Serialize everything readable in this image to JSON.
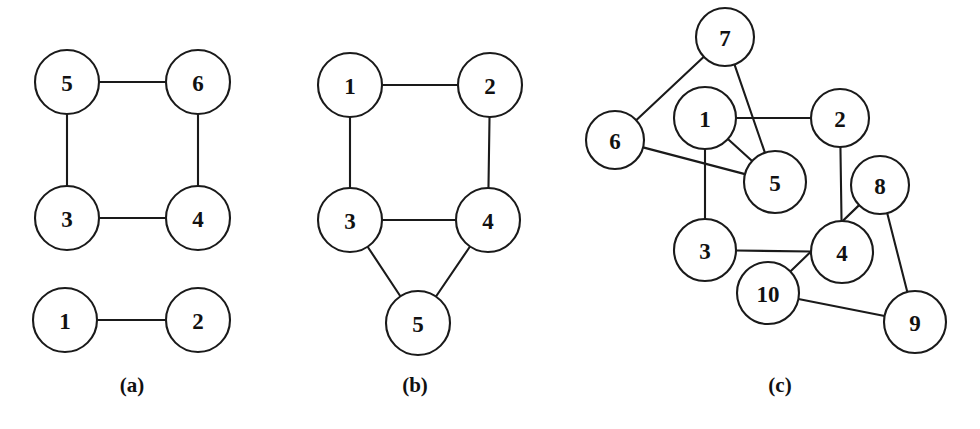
{
  "figure": {
    "background_color": "#ffffff",
    "stroke_color": "#1a1a1a",
    "node_fill_color": "#ffffff",
    "width": 980,
    "height": 429
  },
  "panels": [
    {
      "id": "panel-a",
      "caption": "(a)",
      "caption_x": 132,
      "caption_y": 385,
      "nodes": [
        {
          "label": "5",
          "x": 67,
          "y": 82,
          "r": 32
        },
        {
          "label": "6",
          "x": 198,
          "y": 82,
          "r": 32
        },
        {
          "label": "3",
          "x": 67,
          "y": 218,
          "r": 32
        },
        {
          "label": "4",
          "x": 198,
          "y": 218,
          "r": 32
        },
        {
          "label": "1",
          "x": 65,
          "y": 320,
          "r": 32
        },
        {
          "label": "2",
          "x": 198,
          "y": 320,
          "r": 32
        }
      ],
      "edges": [
        [
          "5",
          "6"
        ],
        [
          "5",
          "3"
        ],
        [
          "3",
          "4"
        ],
        [
          "6",
          "4"
        ],
        [
          "1",
          "2"
        ]
      ]
    },
    {
      "id": "panel-b",
      "caption": "(b)",
      "caption_x": 415,
      "caption_y": 385,
      "nodes": [
        {
          "label": "1",
          "x": 350,
          "y": 85,
          "r": 32
        },
        {
          "label": "2",
          "x": 490,
          "y": 85,
          "r": 32
        },
        {
          "label": "3",
          "x": 350,
          "y": 220,
          "r": 32
        },
        {
          "label": "4",
          "x": 488,
          "y": 220,
          "r": 32
        },
        {
          "label": "5",
          "x": 418,
          "y": 323,
          "r": 32
        }
      ],
      "edges": [
        [
          "1",
          "2"
        ],
        [
          "1",
          "3"
        ],
        [
          "2",
          "4"
        ],
        [
          "3",
          "4"
        ],
        [
          "3",
          "5"
        ],
        [
          "4",
          "5"
        ]
      ]
    },
    {
      "id": "panel-c",
      "caption": "(c)",
      "caption_x": 780,
      "caption_y": 385,
      "nodes": [
        {
          "label": "7",
          "x": 725,
          "y": 37,
          "r": 29
        },
        {
          "label": "6",
          "x": 615,
          "y": 140,
          "r": 29
        },
        {
          "label": "1",
          "x": 705,
          "y": 118,
          "r": 31
        },
        {
          "label": "2",
          "x": 840,
          "y": 118,
          "r": 29
        },
        {
          "label": "5",
          "x": 775,
          "y": 182,
          "r": 31
        },
        {
          "label": "8",
          "x": 880,
          "y": 185,
          "r": 29
        },
        {
          "label": "3",
          "x": 705,
          "y": 250,
          "r": 31
        },
        {
          "label": "4",
          "x": 842,
          "y": 252,
          "r": 31
        },
        {
          "label": "10",
          "x": 768,
          "y": 293,
          "r": 31
        },
        {
          "label": "9",
          "x": 915,
          "y": 322,
          "r": 31
        }
      ],
      "edges": [
        [
          "7",
          "6"
        ],
        [
          "7",
          "5"
        ],
        [
          "6",
          "5"
        ],
        [
          "1",
          "2"
        ],
        [
          "1",
          "3"
        ],
        [
          "1",
          "5"
        ],
        [
          "2",
          "4"
        ],
        [
          "3",
          "4"
        ],
        [
          "8",
          "10"
        ],
        [
          "8",
          "9"
        ],
        [
          "10",
          "9"
        ]
      ]
    }
  ]
}
